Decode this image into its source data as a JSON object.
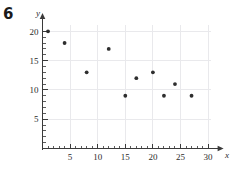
{
  "problem": {
    "number": "6"
  },
  "chart_data": {
    "type": "scatter",
    "title": "",
    "subtitle": "",
    "xlabel": "x",
    "ylabel": "y",
    "xlim": [
      0,
      31
    ],
    "ylim": [
      0,
      21
    ],
    "grid": true,
    "legend": null,
    "x_ticks": [
      5,
      10,
      15,
      20,
      25,
      30
    ],
    "y_ticks": [
      5,
      10,
      15,
      20
    ],
    "x_minor_step": 1,
    "y_minor_step": 1,
    "x_tick_labels": [
      "5",
      "10",
      "15",
      "20",
      "25",
      "30"
    ],
    "y_tick_labels": [
      "5",
      "10",
      "15",
      "20"
    ],
    "series": [
      {
        "name": "",
        "marker": "filled-circle",
        "color": "#2e2e2e",
        "points": [
          {
            "x": 1,
            "y": 20
          },
          {
            "x": 4,
            "y": 18
          },
          {
            "x": 8,
            "y": 13
          },
          {
            "x": 12,
            "y": 17
          },
          {
            "x": 15,
            "y": 9
          },
          {
            "x": 17,
            "y": 12
          },
          {
            "x": 20,
            "y": 13
          },
          {
            "x": 22,
            "y": 9
          },
          {
            "x": 24,
            "y": 11
          },
          {
            "x": 27,
            "y": 9
          }
        ]
      }
    ],
    "colors": {
      "point": "#2e2e2e",
      "axis": "#3a3a3a",
      "grid": "#e9e9ec",
      "text": "#2b2b2b",
      "background": "#ffffff"
    }
  }
}
